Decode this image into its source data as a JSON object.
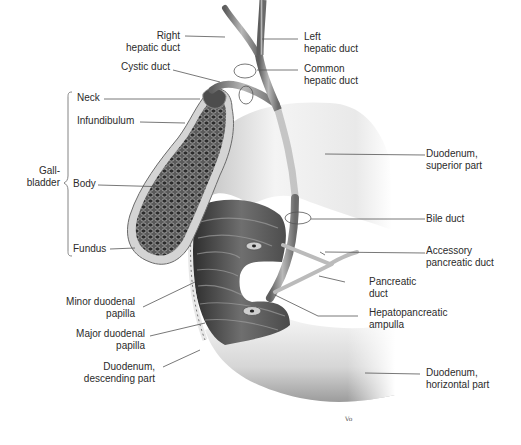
{
  "figure": {
    "artist_signature": "Vo"
  },
  "labels": {
    "right_hepatic_duct": "Right\nhepatic duct",
    "left_hepatic_duct": "Left\nhepatic duct",
    "cystic_duct": "Cystic duct",
    "common_hepatic_duct": "Common\nhepatic duct",
    "neck": "Neck",
    "infundibulum": "Infundibulum",
    "gallbladder": "Gall-\nbladder",
    "body": "Body",
    "fundus": "Fundus",
    "duodenum_superior": "Duodenum,\nsuperior part",
    "bile_duct": "Bile duct",
    "accessory_pancreatic_duct": "Accessory\npancreatic duct",
    "pancreatic_duct": "Pancreatic\nduct",
    "hepatopancreatic_ampulla": "Hepatopancreatic\nampulla",
    "minor_duodenal_papilla": "Minor duodenal\npapilla",
    "major_duodenal_papilla": "Major duodenal\npapilla",
    "duodenum_descending": "Duodenum,\ndescending part",
    "duodenum_horizontal": "Duodenum,\nhorizontal part"
  },
  "colors": {
    "background": "#ffffff",
    "label_text": "#2b2b2b",
    "leader_line": "#555555",
    "duodenum_light": "#f0f0f0",
    "duodenum_shadow": "#9a9a9a",
    "mucosa_dark": "#3a3a3a",
    "duct": "#7a7a7a"
  }
}
